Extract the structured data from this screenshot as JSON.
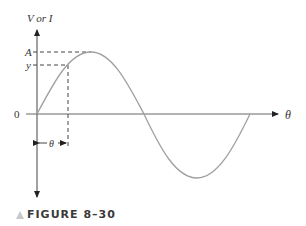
{
  "figure": {
    "caption": "FIGURE 8–30",
    "y_axis_label": "V or I",
    "x_axis_label": "θ",
    "labels": {
      "amplitude": "A",
      "instantaneous": "y",
      "origin": "0",
      "angle": "θ"
    }
  },
  "colors": {
    "curve": "#a0a0a0",
    "axis": "#444444",
    "caption": "#3a3a3a",
    "triangle": "#c8c8c8"
  }
}
